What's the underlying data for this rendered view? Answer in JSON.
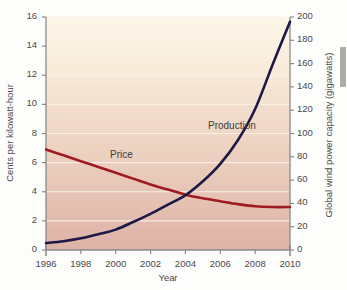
{
  "chart_data": {
    "type": "line",
    "title": "",
    "subtitle": "",
    "xlabel": "Year",
    "ylabel": "Cents per kilowatt-hour",
    "y2label": "Global wind power capacity (gigawatts)",
    "xlim": [
      1996,
      2010
    ],
    "ylim": [
      0,
      16
    ],
    "y2lim": [
      0,
      200
    ],
    "xticks": [
      1996,
      1998,
      2000,
      2002,
      2004,
      2006,
      2008,
      2010
    ],
    "xtick_labels": [
      "1996",
      "1998",
      "2000",
      "2002",
      "2004",
      "2006",
      "2008",
      "2010"
    ],
    "yticks": [
      0,
      2,
      4,
      6,
      8,
      10,
      12,
      14,
      16
    ],
    "ytick_labels": [
      "0",
      "2",
      "4",
      "6",
      "8",
      "10",
      "12",
      "14",
      "16"
    ],
    "y2ticks": [
      0,
      20,
      40,
      60,
      80,
      100,
      120,
      140,
      160,
      180,
      200
    ],
    "y2tick_labels": [
      "0",
      "20",
      "40",
      "60",
      "80",
      "100",
      "120",
      "140",
      "160",
      "180",
      "200"
    ],
    "grid": true,
    "grid_color": "#fbf3ec",
    "legend_position": "inline-annotations",
    "plot_bg_top": "#fdf6e8",
    "plot_bg_bottom": "#e0b7ab",
    "axis_color": "#8a8a8a",
    "series": [
      {
        "name": "Price",
        "axis": "left",
        "color": "#9e1b21",
        "units": "Cents per kilowatt-hour",
        "x": [
          1996,
          1997,
          1998,
          1999,
          2000,
          2001,
          2002,
          2003,
          2004,
          2005,
          2006,
          2007,
          2008,
          2009,
          2010
        ],
        "values": [
          6.9,
          6.5,
          6.1,
          5.7,
          5.3,
          4.9,
          4.5,
          4.15,
          3.8,
          3.55,
          3.35,
          3.15,
          3.0,
          2.95,
          2.95
        ]
      },
      {
        "name": "Production",
        "axis": "right",
        "color": "#1c1947",
        "units": "Gigawatts",
        "x": [
          1996,
          1997,
          1998,
          1999,
          2000,
          2001,
          2002,
          2003,
          2004,
          2005,
          2006,
          2007,
          2008,
          2009,
          2010
        ],
        "values": [
          6,
          7.5,
          10,
          13.5,
          17.5,
          24,
          31,
          39,
          47,
          59,
          74,
          94,
          121,
          159,
          196
        ]
      }
    ],
    "annotations": [
      {
        "text": "Price",
        "series": "Price",
        "x_px": 110,
        "y_px": 149
      },
      {
        "text": "Production",
        "series": "Production",
        "x_px": 208,
        "y_px": 120
      }
    ]
  }
}
